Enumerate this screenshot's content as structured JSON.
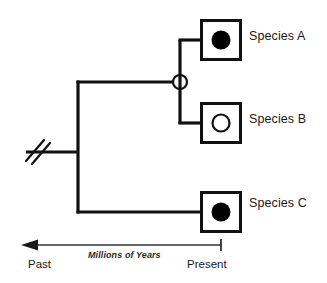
{
  "diagram": {
    "type": "cladogram",
    "title": "",
    "background_color": "#ffffff",
    "line_color": "#111111",
    "taxa": [
      {
        "id": "species-a",
        "label": "Species A",
        "trait_marker": "filled-circle-icon",
        "marker_fill": "#000000",
        "box_x": 200,
        "box_y": 19,
        "box_size": 42
      },
      {
        "id": "species-b",
        "label": "Species B",
        "trait_marker": "open-circle-icon",
        "marker_fill": "#ffffff",
        "box_x": 200,
        "box_y": 102,
        "box_size": 42
      },
      {
        "id": "species-c",
        "label": "Species C",
        "trait_marker": "filled-circle-icon",
        "marker_fill": "#000000",
        "box_x": 200,
        "box_y": 186,
        "box_size": 42
      }
    ],
    "nodes": [
      {
        "id": "ab-common-ancestor",
        "marker": "open-circle-node-icon",
        "x": 180,
        "y": 82,
        "radius": 7,
        "joins": [
          "species-a",
          "species-b"
        ]
      },
      {
        "id": "root-ancestor",
        "marker": "branch-break-icon",
        "x": 78,
        "y": 152,
        "joins": [
          "ab-common-ancestor",
          "species-c"
        ]
      }
    ],
    "root_stem": {
      "break_marker": "double-slash-icon",
      "x_start": 26,
      "x_end": 78,
      "y": 152
    },
    "axis": {
      "title": "Millions of Years",
      "left_label": "Past",
      "right_label": "Present",
      "left_end_marker": "arrowhead-left-icon",
      "right_end_marker": "tick-mark-icon",
      "y": 245,
      "x_start": 22,
      "x_end": 221,
      "direction": "right-to-left"
    }
  }
}
